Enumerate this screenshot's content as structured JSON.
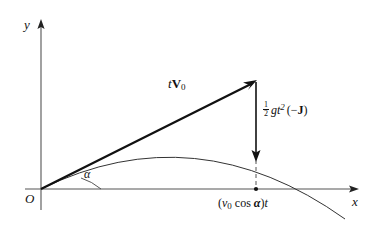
{
  "figure": {
    "background_color": "#ffffff",
    "ink_color": "#111111",
    "dashed_color": "#555555"
  },
  "axes": {
    "y_label": "y",
    "x_label": "x",
    "origin_label": "O",
    "x_axis": {
      "x_start": 25,
      "x_end": 358,
      "y": 189
    },
    "y_axis": {
      "x": 41,
      "y_start": 20,
      "y_end": 210
    }
  },
  "angle": {
    "label": "α",
    "description": "launch angle between x-axis and initial velocity vector"
  },
  "vectors": {
    "velocity": {
      "label_prefix": "t",
      "label_symbol": "V",
      "label_subscript": "0",
      "full_label": "tV₀",
      "from": {
        "x": 41,
        "y": 189
      },
      "to": {
        "x": 256,
        "y": 81
      }
    },
    "gravity_drop": {
      "numerator": "1",
      "denominator": "2",
      "body": "gt",
      "exponent": "2",
      "paren": "(−J)",
      "full_label": "½ gt²(−J)",
      "from": {
        "x": 256,
        "y": 82
      },
      "to": {
        "x": 256,
        "y": 160
      }
    }
  },
  "labels": {
    "horizontal_range": "(v₀ cos α)t",
    "horizontal_range_parts": {
      "open": "(",
      "v": "v",
      "v_sub": "0",
      "cos": "cos",
      "alpha": "α",
      "close": ")",
      "t": "t"
    }
  },
  "curve": {
    "type": "parabola",
    "description": "projectile trajectory starting at origin, apex near x=195, crossing x-axis near x=320",
    "apex": {
      "x": 195,
      "y": 152
    },
    "x_intercept": {
      "x": 320,
      "y": 189
    }
  },
  "markers": {
    "dashed_drop_line": {
      "x": 256,
      "y_start": 160,
      "y_end": 189
    },
    "base_point": {
      "x": 256,
      "y": 189
    }
  }
}
